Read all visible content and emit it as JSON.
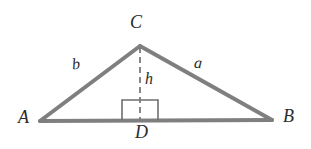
{
  "figure": {
    "type": "geometry-diagram",
    "background_color": "#ffffff",
    "stroke_color": "#7f7f7f",
    "dash_color": "#7a7a7a",
    "box_color": "#6e6e6e",
    "text_color": "#2b2b2b",
    "width": 311,
    "height": 149
  },
  "vertices": {
    "A": {
      "label": "A",
      "x": 40,
      "y": 121
    },
    "B": {
      "label": "B",
      "x": 272,
      "y": 120
    },
    "C": {
      "label": "C",
      "x": 140,
      "y": 46
    },
    "D": {
      "label": "D",
      "x": 140,
      "y": 120
    }
  },
  "sides": {
    "a": {
      "label": "a",
      "from": "C",
      "to": "B"
    },
    "b": {
      "label": "b",
      "from": "A",
      "to": "C"
    },
    "base": {
      "from": "A",
      "to": "B"
    }
  },
  "altitude": {
    "label": "h",
    "from": "C",
    "to": "D",
    "style": "dashed"
  },
  "right_angle_marker": {
    "at": "D",
    "left": 122,
    "right": 158,
    "top": 100,
    "bottom": 120
  }
}
